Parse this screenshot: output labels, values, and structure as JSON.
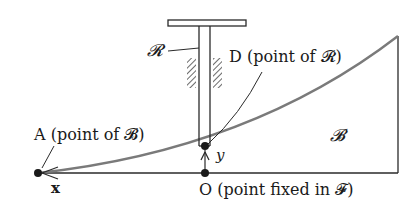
{
  "diagram": {
    "labels": {
      "rod": "𝓡",
      "point_d": "D (point of 𝓡)",
      "point_a": "A (point of 𝓑)",
      "body": "𝓑",
      "x_axis": "x",
      "y_axis": "y",
      "point_o": "O (point fixed in 𝓕)"
    },
    "colors": {
      "line": "#2a2a2a",
      "curve": "#7a7a7a",
      "background": "#ffffff"
    }
  }
}
